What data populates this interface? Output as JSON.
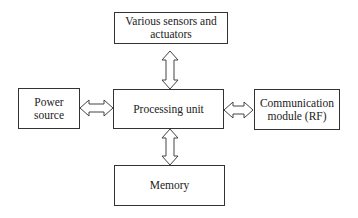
{
  "diagram": {
    "nodes": {
      "sensors": {
        "label": "Various sensors and actuators"
      },
      "power": {
        "label": "Power source"
      },
      "processing": {
        "label": "Processing unit"
      },
      "communication": {
        "label": "Communication module (RF)"
      },
      "memory": {
        "label": "Memory"
      }
    },
    "edges": [
      {
        "from": "sensors",
        "to": "processing",
        "type": "bidirectional"
      },
      {
        "from": "power",
        "to": "processing",
        "type": "bidirectional"
      },
      {
        "from": "processing",
        "to": "communication",
        "type": "bidirectional"
      },
      {
        "from": "processing",
        "to": "memory",
        "type": "bidirectional"
      }
    ]
  }
}
